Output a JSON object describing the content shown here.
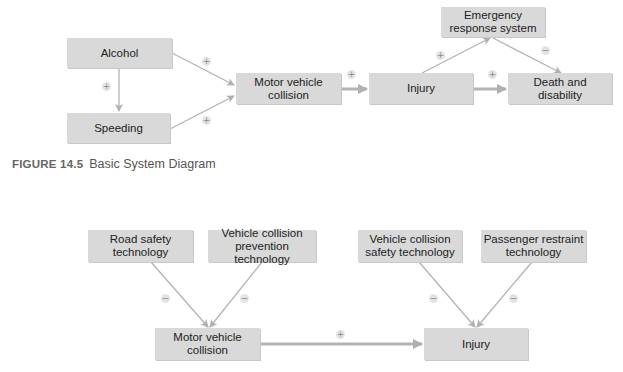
{
  "figure_1": {
    "caption_number": "FIGURE 14.5",
    "caption_text": "Basic System Diagram",
    "nodes": [
      {
        "id": "alcohol",
        "label": "Alcohol"
      },
      {
        "id": "speeding",
        "label": "Speeding"
      },
      {
        "id": "mvc",
        "label": "Motor vehicle\ncollision"
      },
      {
        "id": "injury",
        "label": "Injury"
      },
      {
        "id": "ers",
        "label": "Emergency\nresponse system"
      },
      {
        "id": "death",
        "label": "Death and\ndisability"
      }
    ],
    "edges": [
      {
        "from": "alcohol",
        "to": "speeding",
        "sign": "+"
      },
      {
        "from": "alcohol",
        "to": "mvc",
        "sign": "+"
      },
      {
        "from": "speeding",
        "to": "mvc",
        "sign": "+"
      },
      {
        "from": "mvc",
        "to": "injury",
        "sign": "+"
      },
      {
        "from": "injury",
        "to": "ers",
        "sign": "+"
      },
      {
        "from": "ers",
        "to": "death",
        "sign": "−"
      },
      {
        "from": "injury",
        "to": "death",
        "sign": "+"
      }
    ]
  },
  "figure_2": {
    "nodes": [
      {
        "id": "road_safety",
        "label": "Road safety\ntechnology"
      },
      {
        "id": "vcpt",
        "label": "Vehicle collision\nprevention technology"
      },
      {
        "id": "mvc",
        "label": "Motor vehicle\ncollision"
      },
      {
        "id": "vcst",
        "label": "Vehicle collision\nsafety technology"
      },
      {
        "id": "prt",
        "label": "Passenger restraint\ntechnology"
      },
      {
        "id": "injury",
        "label": "Injury"
      }
    ],
    "edges": [
      {
        "from": "road_safety",
        "to": "mvc",
        "sign": "−"
      },
      {
        "from": "vcpt",
        "to": "mvc",
        "sign": "−"
      },
      {
        "from": "mvc",
        "to": "injury",
        "sign": "+"
      },
      {
        "from": "vcst",
        "to": "injury",
        "sign": "−"
      },
      {
        "from": "prt",
        "to": "injury",
        "sign": "−"
      }
    ]
  },
  "colors": {
    "box_fill": "#d9d9d9",
    "arrow": "#b3b3b3",
    "text": "#222222"
  }
}
